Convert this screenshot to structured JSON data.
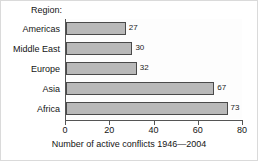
{
  "chart_data": {
    "type": "bar",
    "orientation": "horizontal",
    "title": "",
    "xlabel": "Number of active conflicts 1946—2004",
    "ylabel": "Region:",
    "categories": [
      "Americas",
      "Middle East",
      "Europe",
      "Asia",
      "Africa"
    ],
    "values": [
      27,
      30,
      32,
      67,
      73
    ],
    "data_labels": [
      "27",
      "30",
      "32",
      "67",
      "73"
    ],
    "xlim": [
      0,
      80
    ],
    "xticks": [
      0,
      20,
      40,
      60,
      80
    ],
    "xtick_labels": [
      "0",
      "20",
      "40",
      "60",
      "80"
    ],
    "grid": false,
    "legend": false,
    "bar_fill_color": "#b9b9b9",
    "bar_edge_color": "#4a4a4a",
    "axis_color": "#555555",
    "background_color": "#ffffff"
  },
  "frame": {
    "border_color": "#dadada"
  }
}
